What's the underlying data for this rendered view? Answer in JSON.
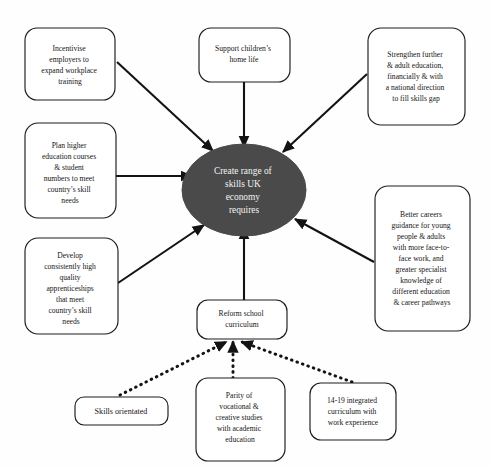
{
  "diagram": {
    "type": "concept-map",
    "title": "Create range of skills UK economy requires",
    "center": {
      "id": "center",
      "label": "Create range of skills UK economy requires",
      "lines": [
        "Create range of",
        "skills UK",
        "economy",
        "requires"
      ],
      "shape": "ellipse",
      "fill": "#4a4a4a",
      "text_color": "#f2f2f2"
    },
    "nodes": [
      {
        "id": "incentivise-employers",
        "label": "Incentivise employers to expand workplace training",
        "lines": [
          "Incentivise",
          "employers to",
          "expand workplace",
          "training"
        ],
        "shape": "rounded-rect",
        "position": "top-left"
      },
      {
        "id": "support-children",
        "label": "Support children's home life",
        "lines": [
          "Support children’s",
          "home life"
        ],
        "shape": "rounded-rect",
        "position": "top-center"
      },
      {
        "id": "strengthen-further-education",
        "label": "Strengthen further & adult education, financially & with a national direction to fill skills gap",
        "lines": [
          "Strengthen further",
          "& adult education,",
          "financially & with",
          "a national direction",
          "to fill skills gap"
        ],
        "shape": "rounded-rect",
        "position": "top-right"
      },
      {
        "id": "plan-higher-education",
        "label": "Plan higher education courses & student numbers to meet country's skill needs",
        "lines": [
          "Plan higher",
          "education courses",
          "& student",
          "numbers to meet",
          "country’s skill",
          "needs"
        ],
        "shape": "rounded-rect",
        "position": "mid-left"
      },
      {
        "id": "develop-apprenticeships",
        "label": "Develop consistently high quality apprenticeships that meet country's skill needs",
        "lines": [
          "Develop",
          "consistently high",
          "quality",
          "apprenticeships",
          "that meet",
          "country’s skill",
          "needs"
        ],
        "shape": "rounded-rect",
        "position": "bottom-left"
      },
      {
        "id": "better-careers-guidance",
        "label": "Better careers guidance for young people & adults with more face-to-face work, and greater specialist knowledge of different education & career pathways",
        "lines": [
          "Better careers",
          "guidance for young",
          "people & adults",
          "with more face-to-",
          "face work, and",
          "greater specialist",
          "knowledge of",
          "different education",
          "& career pathways"
        ],
        "shape": "rounded-rect",
        "position": "mid-right"
      },
      {
        "id": "reform-school-curriculum",
        "label": "Reform school curriculum",
        "lines": [
          "Reform school",
          "curriculum"
        ],
        "shape": "rounded-rect",
        "position": "bottom-center"
      },
      {
        "id": "skills-orientated",
        "label": "Skills orientated",
        "lines": [
          "Skills orientated"
        ],
        "shape": "rounded-rect",
        "position": "bottom-row-left"
      },
      {
        "id": "parity-vocational-creative",
        "label": "Parity of vocational & creative studies with academic education",
        "lines": [
          "Parity of",
          "vocational &",
          "creative studies",
          "with academic",
          "education"
        ],
        "shape": "rounded-rect",
        "position": "bottom-row-center"
      },
      {
        "id": "integrated-curriculum",
        "label": "14-19 integrated curriculum with work experience",
        "lines": [
          "14-19 integrated",
          "curriculum with",
          "work experience"
        ],
        "shape": "rounded-rect",
        "position": "bottom-row-right"
      }
    ],
    "edges": [
      {
        "from": "incentivise-employers",
        "to": "center",
        "style": "solid",
        "arrow": "to"
      },
      {
        "from": "support-children",
        "to": "center",
        "style": "solid",
        "arrow": "to"
      },
      {
        "from": "strengthen-further-education",
        "to": "center",
        "style": "solid",
        "arrow": "to"
      },
      {
        "from": "plan-higher-education",
        "to": "center",
        "style": "solid",
        "arrow": "to"
      },
      {
        "from": "develop-apprenticeships",
        "to": "center",
        "style": "solid",
        "arrow": "to"
      },
      {
        "from": "better-careers-guidance",
        "to": "center",
        "style": "solid",
        "arrow": "to"
      },
      {
        "from": "reform-school-curriculum",
        "to": "center",
        "style": "solid",
        "arrow": "to"
      },
      {
        "from": "skills-orientated",
        "to": "reform-school-curriculum",
        "style": "dotted",
        "arrow": "to"
      },
      {
        "from": "parity-vocational-creative",
        "to": "reform-school-curriculum",
        "style": "dotted",
        "arrow": "to"
      },
      {
        "from": "integrated-curriculum",
        "to": "reform-school-curriculum",
        "style": "dotted",
        "arrow": "to"
      }
    ],
    "colors": {
      "background": "#fefefe",
      "stroke": "#131313",
      "center_fill": "#4a4a4a",
      "node_fill": "#ffffff"
    }
  }
}
